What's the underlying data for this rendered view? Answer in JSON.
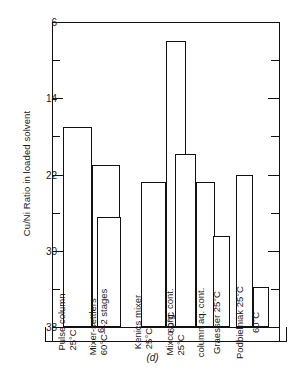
{
  "figure": {
    "caption": "(d)",
    "y_axis_title": "Cu/Ni Ratio in loaded solvent"
  },
  "axis": {
    "ticks": [
      "38",
      "30",
      "22",
      "14",
      "6"
    ]
  },
  "chart_data": {
    "type": "bar",
    "title": "",
    "subtitle": "(d)",
    "xlabel": "",
    "ylabel": "Cu/Ni Ratio in loaded solvent",
    "ylim": [
      6,
      38
    ],
    "yticks": [
      6,
      14,
      22,
      30,
      38
    ],
    "minor_ticks": [
      10,
      18,
      26,
      34
    ],
    "grid": false,
    "legend": "none",
    "orientation": "vertical",
    "note": "Bar labels are printed vertically inside each bar.",
    "categories": [
      "Pulse column 25°C",
      "Pulse column 60°C",
      "Mixer-settlers 60°C—2 stages",
      "Kenics mixer 25°C",
      "Kenics mixer 60°C",
      "Mixco org. cont. 25°C",
      "Mixco column aq. cont.",
      "Graesser 25°C",
      "Podbielniak 25°C",
      "Podbielniak 60°C"
    ],
    "values": [
      27.0,
      23.0,
      17.5,
      21.2,
      36.0,
      24.1,
      21.2,
      15.6,
      22.0,
      10.2
    ]
  },
  "bars": [
    {
      "id": "pulse-column-25",
      "label_line1": "Pulse column",
      "label_line2": "25°C",
      "value": 27.0
    },
    {
      "id": "pulse-column-60",
      "label_line1": "",
      "label_line2": "60°C",
      "value": 23.0
    },
    {
      "id": "mixer-settlers",
      "label_line1": "Mixer-settlers",
      "label_line2": "60°C—2 stages",
      "value": 17.5
    },
    {
      "id": "kenics-mixer-25",
      "label_line1": "Kenics mixer",
      "label_line2": "25°C",
      "value": 21.2
    },
    {
      "id": "kenics-mixer-60",
      "label_line1": "",
      "label_line2": "60°C",
      "value": 36.0
    },
    {
      "id": "mixco-org-cont-25",
      "label_line1": "Mixco org. cont.",
      "label_line2": "25°C",
      "value": 24.1
    },
    {
      "id": "mixco-column-aq-cont",
      "label_line1": "column aq. cont.",
      "label_line2": "",
      "value": 21.2
    },
    {
      "id": "graesser-25",
      "label_line1": "Graesser 25°C",
      "label_line2": "",
      "value": 15.6
    },
    {
      "id": "podbielniak-25",
      "label_line1": "Podbielniak 25°C",
      "label_line2": "",
      "value": 22.0
    },
    {
      "id": "podbielniak-60",
      "label_line1": "",
      "label_line2": "60°C",
      "value": 10.2
    }
  ]
}
